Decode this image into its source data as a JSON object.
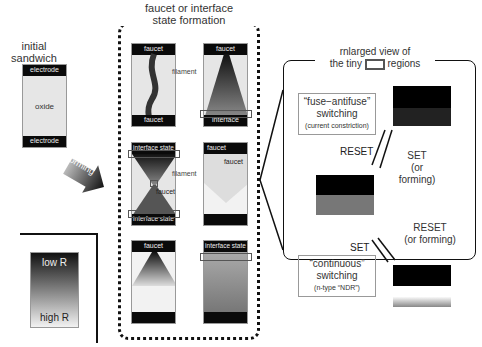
{
  "initial": {
    "title_line1": "initial",
    "title_line2": "sandwich",
    "top_electrode": "electrode",
    "middle": "oxide",
    "bottom_electrode": "electrode"
  },
  "forming_arrow": {
    "label": "forming"
  },
  "formation_panel": {
    "title_line1": "faucet or interface",
    "title_line2": "state formation",
    "row1": {
      "left": {
        "top": "faucet",
        "bottom": "faucet"
      },
      "right": {
        "top": "faucet",
        "bottom": "interface state"
      },
      "label": "filament"
    },
    "row2": {
      "left": {
        "top": "interface state",
        "bottom": "interface state",
        "mid": "faucet"
      },
      "right": {
        "top": "faucet",
        "inner": "faucet"
      },
      "label": "filament"
    },
    "row3": {
      "left": {
        "top": "faucet"
      },
      "right": {
        "top": "interface state"
      }
    }
  },
  "legend": {
    "top": "low R",
    "bottom": "high R"
  },
  "enlarged": {
    "title_line1": "rnlarged view of",
    "title_prefix": "the tiny",
    "title_suffix": "regions",
    "fuse_box": {
      "line1": "“fuse−antifuse”",
      "line2": "switching",
      "line3": "(current constriction)"
    },
    "continuous_box": {
      "line1": "“continuous”",
      "line2": "switching",
      "line3": "(n-type “NDR”)"
    },
    "upper_arrows": {
      "reset": "RESET",
      "set": "SET",
      "set_note": "(or forming)"
    },
    "lower_arrows": {
      "reset": "RESET",
      "reset_note": "(or forming)",
      "set": "SET"
    }
  }
}
